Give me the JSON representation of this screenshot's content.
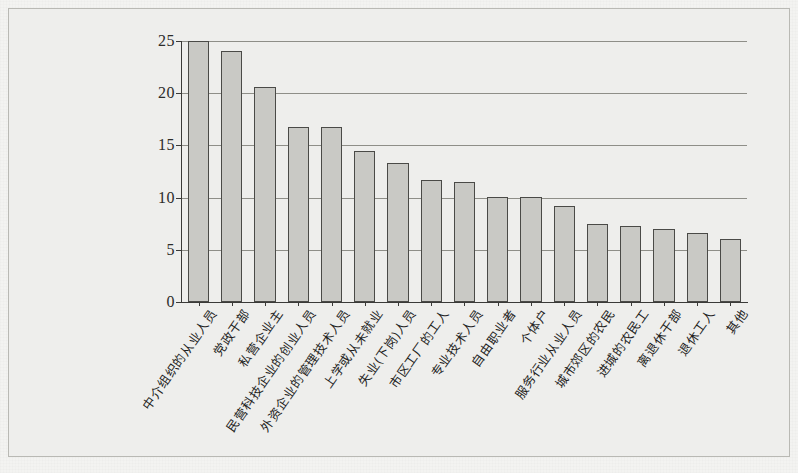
{
  "chart_data": {
    "type": "bar",
    "title": "",
    "subtitle": "",
    "xlabel": "",
    "ylabel": "",
    "ylim": [
      0,
      25
    ],
    "yticks": [
      0,
      5,
      10,
      15,
      20,
      25
    ],
    "ytick_labels": [
      "0",
      "5",
      "10",
      "15",
      "20",
      "25"
    ],
    "grid": true,
    "gridlines_at": [
      5,
      10,
      15,
      20,
      25
    ],
    "legend": null,
    "legend_position": "none",
    "bar_fill_color": "#c9c9c5",
    "bar_edge_color": "#4a4a47",
    "panel_background": "#eeeeec",
    "categories": [
      "中介组织的从业人员",
      "党政干部",
      "私营企业主",
      "民营科技企业的创业人员",
      "外资企业的管理技术人员",
      "上学或从未就业",
      "失业(下岗)人员",
      "市区工厂的工人",
      "专业技术人员",
      "自由职业者",
      "个体户",
      "服务行业从业人员",
      "城市郊区的农民",
      "进城的农民工",
      "离退休干部",
      "退休工人",
      "其他"
    ],
    "values": [
      25.0,
      24.0,
      20.6,
      16.8,
      16.8,
      14.5,
      13.3,
      11.7,
      11.5,
      10.1,
      10.1,
      9.2,
      7.5,
      7.3,
      7.0,
      6.6,
      6.0
    ]
  }
}
